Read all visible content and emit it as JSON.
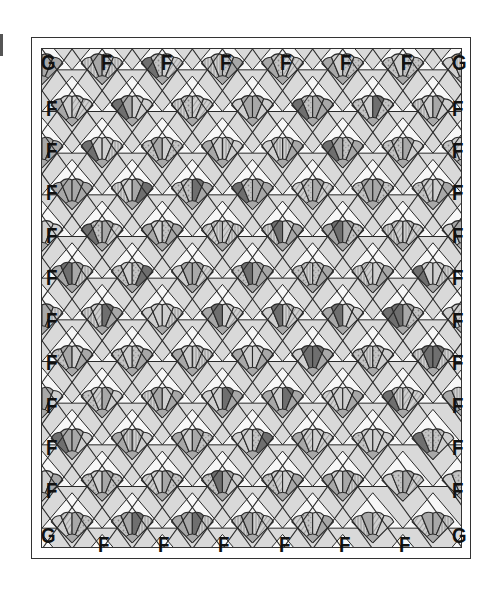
{
  "diagram": {
    "title": "",
    "grid": {
      "rows": 12,
      "cols": 7
    },
    "colors": {
      "background": "#d9d9d9",
      "outline": "#2a2a2a",
      "white": "#f7f7f7",
      "light": "#cfcfcf",
      "medium": "#a8a8a8",
      "dark": "#6f6f6f"
    },
    "corner_labels": {
      "top_left": "G",
      "top_right": "G",
      "bottom_left": "G",
      "bottom_right": "G"
    },
    "top_labels": [
      "F",
      "F",
      "F",
      "F",
      "F",
      "F"
    ],
    "bottom_labels": [
      "F",
      "F",
      "F",
      "F",
      "F",
      "F"
    ],
    "left_labels": [
      "F",
      "F",
      "F",
      "F",
      "F",
      "F",
      "F",
      "F",
      "F",
      "F"
    ],
    "right_labels": [
      "F",
      "F",
      "F",
      "F",
      "F",
      "F",
      "F",
      "F",
      "F",
      "F"
    ],
    "legend": {
      "G": "corner setting triangle",
      "F": "side setting triangle"
    }
  }
}
